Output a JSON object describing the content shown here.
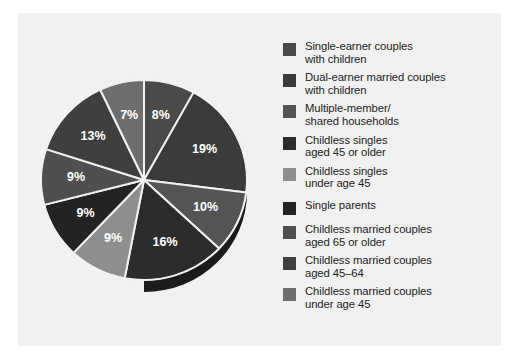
{
  "chart_data": {
    "type": "pie",
    "title": "",
    "subtitle": "",
    "xlabel": "",
    "ylabel": "",
    "legend_position": "right",
    "grid": false,
    "units": "percent",
    "start_angle_deg": 0,
    "direction": "clockwise",
    "categories": [
      "Single-earner couples with children",
      "Dual-earner married couples with children",
      "Multiple-member/ shared households",
      "Childless singles aged 45 or older",
      "Childless singles under age 45",
      "Single parents",
      "Childless married couples aged 65 or older",
      "Childless married couples aged 45–64",
      "Childless married couples under age 45"
    ],
    "values": [
      8,
      19,
      10,
      16,
      9,
      9,
      9,
      13,
      7
    ],
    "value_labels": [
      "8%",
      "19%",
      "10%",
      "16%",
      "9%",
      "9%",
      "9%",
      "13%",
      "7%"
    ],
    "colors": [
      "#4a4a4a",
      "#3b3b3b",
      "#545454",
      "#2c2c2c",
      "#8e8e8e",
      "#232323",
      "#4f4f4f",
      "#3f3f3f",
      "#6e6e6e"
    ]
  },
  "legend": {
    "items": [
      {
        "label": "Single-earner couples\nwith children",
        "color": "#4a4a4a",
        "swatch_name": "legend-swatch-single-earner-couples-with-children"
      },
      {
        "label": "Dual-earner married couples\nwith children",
        "color": "#3b3b3b",
        "swatch_name": "legend-swatch-dual-earner-married-couples-with-children"
      },
      {
        "label": "Multiple-member/\nshared households",
        "color": "#545454",
        "swatch_name": "legend-swatch-multiple-member-shared-households"
      },
      {
        "label": "Childless singles\naged 45 or older",
        "color": "#2c2c2c",
        "swatch_name": "legend-swatch-childless-singles-45-or-older"
      },
      {
        "label": "Childless singles\nunder age 45",
        "color": "#8e8e8e",
        "swatch_name": "legend-swatch-childless-singles-under-45"
      },
      {
        "label": "Single parents",
        "color": "#232323",
        "swatch_name": "legend-swatch-single-parents"
      },
      {
        "label": "Childless married couples\naged 65 or older",
        "color": "#4f4f4f",
        "swatch_name": "legend-swatch-childless-married-couples-65-or-older"
      },
      {
        "label": "Childless married couples\naged 45–64",
        "color": "#3f3f3f",
        "swatch_name": "legend-swatch-childless-married-couples-45-64"
      },
      {
        "label": "Childless married couples\nunder age 45",
        "color": "#6e6e6e",
        "swatch_name": "legend-swatch-childless-married-couples-under-45"
      }
    ]
  },
  "pie_geometry": {
    "center_x": 114,
    "center_y": 120,
    "radius_x": 103,
    "radius_y": 100,
    "depth": 12,
    "separator_color": "#f1f1f1",
    "side_color": "#1b1b1b"
  }
}
